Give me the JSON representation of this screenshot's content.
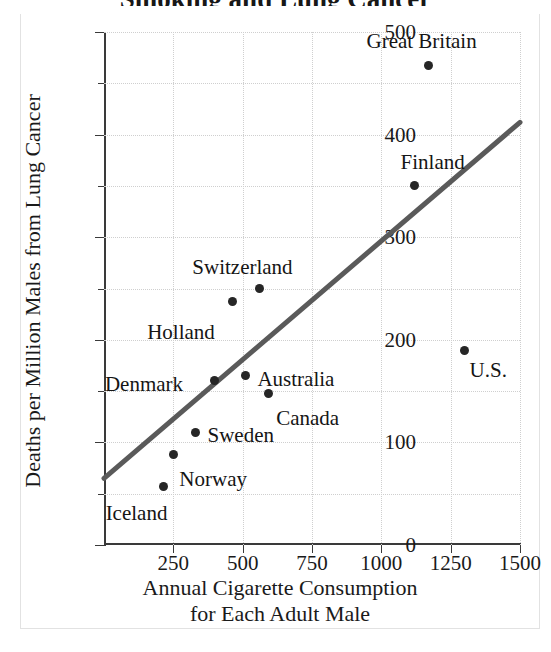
{
  "figure": {
    "title_clipped": "Smoking and Lung Cancer",
    "background_color": "#ffffff",
    "line_color": "#5a5a5a",
    "point_color": "#262626"
  },
  "chart_data": {
    "type": "scatter",
    "title": "Smoking and Lung Cancer",
    "xlabel_line1": "Annual Cigarette Consumption",
    "xlabel_line2": "for Each Adult Male",
    "ylabel": "Deaths per Million Males from Lung Cancer",
    "xlim": [
      0,
      1500
    ],
    "ylim": [
      0,
      500
    ],
    "xticks": [
      0,
      250,
      500,
      750,
      1000,
      1250,
      1500
    ],
    "xticklabels": [
      "",
      "250",
      "500",
      "750",
      "1000",
      "1250",
      "1500"
    ],
    "yticks": [
      0,
      100,
      200,
      300,
      400,
      500
    ],
    "yticklabels": [
      "0",
      "100",
      "200",
      "300",
      "400",
      "500"
    ],
    "y_minor_ticks": [
      50,
      150,
      250,
      350,
      450
    ],
    "grid": true,
    "grid_style": "dotted",
    "zero_tick_label": "0",
    "points": [
      {
        "label": "Iceland",
        "x": 215,
        "y": 57,
        "label_dx": -58,
        "label_dy": 26
      },
      {
        "label": "Norway",
        "x": 250,
        "y": 88,
        "label_dx": 6,
        "label_dy": 24
      },
      {
        "label": "Sweden",
        "x": 330,
        "y": 110,
        "label_dx": 12,
        "label_dy": 3
      },
      {
        "label": "Denmark",
        "x": 400,
        "y": 160,
        "label_dx": -110,
        "label_dy": 3
      },
      {
        "label": "Australia",
        "x": 510,
        "y": 165,
        "label_dx": 12,
        "label_dy": 3
      },
      {
        "label": "Canada",
        "x": 592,
        "y": 148,
        "label_dx": 8,
        "label_dy": 25
      },
      {
        "label": "Holland",
        "x": 462,
        "y": 237,
        "label_dx": -85,
        "label_dy": 30
      },
      {
        "label": "Switzerland",
        "x": 560,
        "y": 250,
        "label_dx": -67,
        "label_dy": -22
      },
      {
        "label": "Finland",
        "x": 1120,
        "y": 350,
        "label_dx": -14,
        "label_dy": -24
      },
      {
        "label": "Great Britain",
        "x": 1170,
        "y": 467,
        "label_dx": -62,
        "label_dy": -25
      },
      {
        "label": "U.S.",
        "x": 1300,
        "y": 190,
        "label_dx": 5,
        "label_dy": 20
      }
    ],
    "trendline": {
      "name": "least-squares regression line",
      "x_start": 0,
      "y_start": 65,
      "x_end": 1500,
      "y_end": 412
    }
  }
}
